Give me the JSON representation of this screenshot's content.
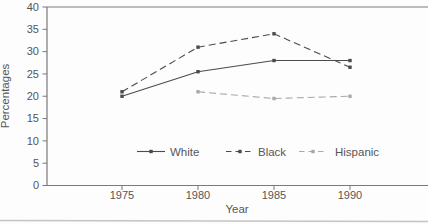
{
  "figure": {
    "kind": "scanned line chart",
    "title": ""
  },
  "axes": {
    "y_title": "Percentages",
    "x_title": "Year",
    "y_tick_labels": [
      "0",
      "5",
      "10",
      "15",
      "20",
      "25",
      "30",
      "35",
      "40"
    ],
    "x_tick_labels": [
      "1975",
      "1980",
      "1985",
      "1990"
    ]
  },
  "legend": {
    "items": [
      "White",
      "Black",
      "Hispanic"
    ]
  },
  "chart_data": {
    "type": "line",
    "title": "",
    "xlabel": "Year",
    "ylabel": "Percentages",
    "x": [
      1975,
      1980,
      1985,
      1990
    ],
    "ylim": [
      0,
      40
    ],
    "y_tick_step": 5,
    "grid": false,
    "legend_position": "bottom-center-inside",
    "series": [
      {
        "name": "White",
        "values": [
          20,
          25.5,
          28,
          28
        ],
        "line_style": "solid",
        "marker": "square",
        "color": "#4b4b4b"
      },
      {
        "name": "Black",
        "values": [
          21,
          31,
          34,
          26.5
        ],
        "line_style": "dashed",
        "marker": "square",
        "color": "#4b4b4b"
      },
      {
        "name": "Hispanic",
        "values": [
          null,
          21,
          19.5,
          20
        ],
        "line_style": "dashed",
        "marker": "square",
        "color": "#a9a9a9"
      }
    ]
  },
  "colors": {
    "axis_frame": "#7a7a7a",
    "text": "#565656",
    "page_edge": "#c4c4c4"
  }
}
